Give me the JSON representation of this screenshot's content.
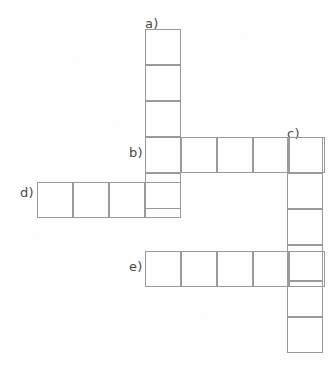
{
  "puzzle": {
    "type": "crossword-skeleton",
    "cell_size": 36,
    "stroke_color": "#9a9a9a",
    "label_color": "#4a4a4a",
    "background_color": "#fefefe",
    "entries": [
      {
        "id": "a",
        "label": "a)",
        "direction": "down",
        "cells": 5,
        "label_x": 145,
        "label_y": 17,
        "origin_x": 145,
        "origin_y": 29
      },
      {
        "id": "b",
        "label": "b)",
        "direction": "across",
        "cells": 5,
        "label_x": 129,
        "label_y": 146,
        "origin_x": 145,
        "origin_y": 137
      },
      {
        "id": "c",
        "label": "c)",
        "direction": "down",
        "cells": 6,
        "label_x": 287,
        "label_y": 127,
        "origin_x": 287,
        "origin_y": 137
      },
      {
        "id": "d",
        "label": "d)",
        "direction": "across",
        "cells": 4,
        "label_x": 20,
        "label_y": 186,
        "origin_x": 37,
        "origin_y": 182
      },
      {
        "id": "e",
        "label": "e)",
        "direction": "across",
        "cells": 5,
        "label_x": 129,
        "label_y": 260,
        "origin_x": 145,
        "origin_y": 251
      }
    ]
  }
}
